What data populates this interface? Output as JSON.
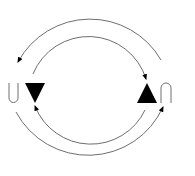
{
  "diagram": {
    "colors": {
      "line": "#6e6e6e",
      "fill": "#000000",
      "background": "#ffffff"
    },
    "outer_cycle": {
      "top_arc": {
        "direction": "right-to-left",
        "arrowhead": "left"
      },
      "bottom_arc": {
        "direction": "left-to-right",
        "arrowhead": "right"
      }
    },
    "inner_cycle": {
      "top_arc": {
        "direction": "left-to-right",
        "arrowhead": "right"
      },
      "bottom_arc": {
        "direction": "right-to-left",
        "arrowhead": "left"
      }
    },
    "markers": [
      {
        "name": "down-triangle",
        "position": "left"
      },
      {
        "name": "up-triangle",
        "position": "right"
      }
    ],
    "symbols": [
      {
        "name": "u-shape",
        "position": "left",
        "orientation": "open-top"
      },
      {
        "name": "inverted-u-shape",
        "position": "right",
        "orientation": "open-bottom"
      }
    ]
  }
}
